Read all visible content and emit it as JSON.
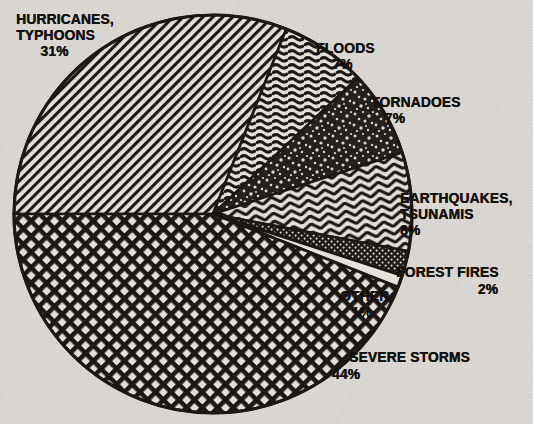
{
  "background_color": "#dcd8d3",
  "ink_color": "#14110f",
  "chart_data": {
    "type": "pie",
    "title": "",
    "subtitle": "",
    "xlabel": "",
    "ylabel": "",
    "legend_position": "callout-labels",
    "grid": false,
    "units": "percent",
    "start_angle_deg": 180,
    "direction": "clockwise",
    "center": {
      "x": 213,
      "y": 214
    },
    "radius": 199,
    "categories": [
      "HURRICANES, TYPHOONS",
      "FLOODS",
      "TORNADOES",
      "EARTHQUAKES, TSUNAMIS",
      "FOREST FIRES",
      "OTHER",
      "SEVERE STORMS"
    ],
    "values": [
      31,
      7,
      7,
      8,
      2,
      1,
      44
    ],
    "slices": [
      {
        "name": "HURRICANES, TYPHOONS",
        "label_line1": "HURRICANES,",
        "label_line2": "TYPHOONS",
        "value": 31,
        "percent_text": "31%",
        "pattern": "diagonal-hatch",
        "start_deg": 180,
        "end_deg": 291.6
      },
      {
        "name": "FLOODS",
        "label_line1": "FLOODS",
        "label_line2": "",
        "value": 7,
        "percent_text": "7%",
        "pattern": "wavy-lines",
        "start_deg": 291.6,
        "end_deg": 316.8
      },
      {
        "name": "TORNADOES",
        "label_line1": "TORNADOES",
        "label_line2": "",
        "value": 7,
        "percent_text": "7%",
        "pattern": "speckle",
        "start_deg": 316.8,
        "end_deg": 342.0
      },
      {
        "name": "EARTHQUAKES, TSUNAMIS",
        "label_line1": "EARTHQUAKES,",
        "label_line2": "TSUNAMIS",
        "value": 8,
        "percent_text": "8%",
        "pattern": "zigzag-chevron",
        "start_deg": 342.0,
        "end_deg": 10.8
      },
      {
        "name": "FOREST FIRES",
        "label_line1": "FOREST FIRES",
        "label_line2": "",
        "value": 2,
        "percent_text": "2%",
        "pattern": "dense-dots",
        "start_deg": 10.8,
        "end_deg": 18.0
      },
      {
        "name": "OTHER",
        "label_line1": "OTHER",
        "label_line2": "",
        "value": 1,
        "percent_text": "1%",
        "pattern": "blank-white",
        "start_deg": 18.0,
        "end_deg": 21.6
      },
      {
        "name": "SEVERE STORMS",
        "label_line1": "SEVERE STORMS",
        "label_line2": "",
        "value": 44,
        "percent_text": "44%",
        "pattern": "cross-hatch-diamond",
        "start_deg": 21.6,
        "end_deg": 180.0
      }
    ]
  },
  "labels": {
    "hurricanes": {
      "line1": "HURRICANES,",
      "line2": "TYPHOONS",
      "pct": "31%"
    },
    "floods": {
      "line1": "FLOODS",
      "pct": "7%"
    },
    "tornadoes": {
      "line1": "TORNADOES",
      "pct": "7%"
    },
    "earthquakes": {
      "line1": "EARTHQUAKES,",
      "line2": "TSUNAMIS",
      "pct": "8%"
    },
    "forest_fires": {
      "line1": "FOREST FIRES",
      "pct": "2%"
    },
    "other": {
      "line1": "OTHER",
      "pct": "1%"
    },
    "severe_storms": {
      "line1": "SEVERE STORMS",
      "pct": "44%"
    }
  }
}
